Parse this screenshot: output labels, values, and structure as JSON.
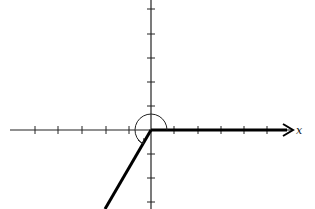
{
  "diagram": {
    "type": "angle-in-standard-position",
    "x_axis_label": "x",
    "origin": [
      151,
      130
    ],
    "tick_spacing_px": 23.5,
    "x_ticks_negative": 5,
    "x_ticks_positive": 5,
    "y_ticks_positive": 5,
    "y_ticks_negative": 3,
    "terminal_ray": {
      "from": [
        151,
        130
      ],
      "to": [
        105,
        209
      ]
    },
    "initial_ray": {
      "from": [
        151,
        130
      ],
      "to": [
        288,
        130
      ]
    },
    "angle_arc": {
      "radius": 16,
      "start_deg": 0,
      "end_deg": 238,
      "direction": "counterclockwise"
    },
    "colors": {
      "axis": "#222222",
      "ray": "#000000",
      "background": "#ffffff"
    }
  }
}
